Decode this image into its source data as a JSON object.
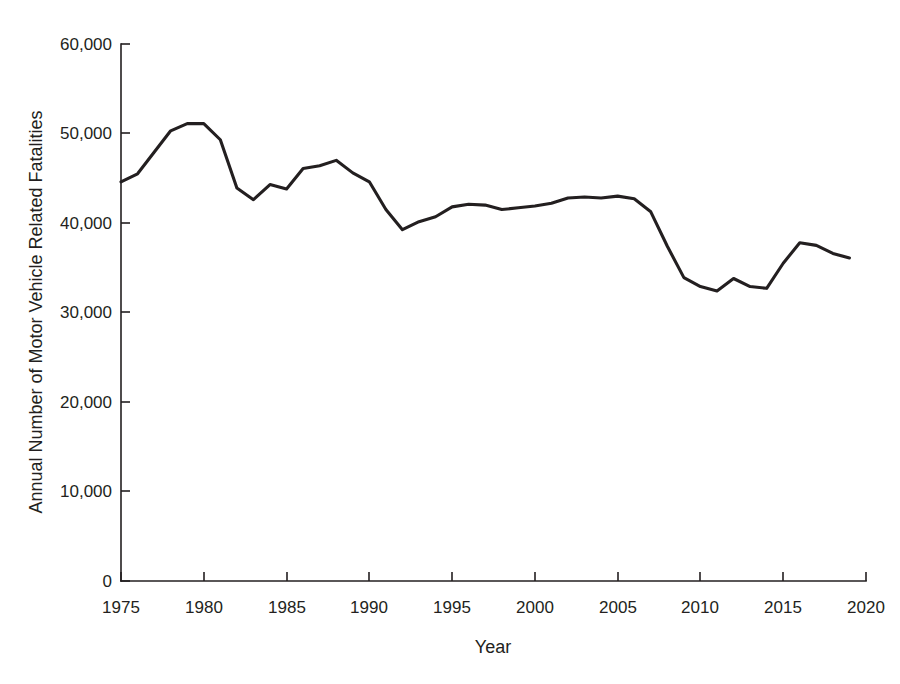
{
  "chart_data": {
    "type": "line",
    "title": "",
    "xlabel": "Year",
    "ylabel": "Annual Number of Motor Vehicle Related Fatalities",
    "xlim": [
      1975,
      2020
    ],
    "ylim": [
      0,
      60000
    ],
    "grid": false,
    "legend": "none",
    "line_color": "#231f20",
    "background_color": "#ffffff",
    "x_tick_labels": [
      "1975",
      "1980",
      "1985",
      "1990",
      "1995",
      "2000",
      "2005",
      "2010",
      "2015",
      "2020"
    ],
    "x_ticks": [
      1975,
      1980,
      1985,
      1990,
      1995,
      2000,
      2005,
      2010,
      2015,
      2020
    ],
    "y_tick_labels": [
      "0",
      "10,000",
      "20,000",
      "30,000",
      "40,000",
      "50,000",
      "60,000"
    ],
    "y_ticks": [
      0,
      10000,
      20000,
      30000,
      40000,
      50000,
      60000
    ],
    "x": [
      1975,
      1976,
      1977,
      1978,
      1979,
      1980,
      1981,
      1982,
      1983,
      1984,
      1985,
      1986,
      1987,
      1988,
      1989,
      1990,
      1991,
      1992,
      1993,
      1994,
      1995,
      1996,
      1997,
      1998,
      1999,
      2000,
      2001,
      2002,
      2003,
      2004,
      2005,
      2006,
      2007,
      2008,
      2009,
      2010,
      2011,
      2012,
      2013,
      2014,
      2015,
      2016,
      2017,
      2018,
      2019
    ],
    "values": [
      44600,
      45500,
      47900,
      50300,
      51100,
      51100,
      49300,
      43900,
      42600,
      44300,
      43800,
      46100,
      46400,
      47000,
      45600,
      44600,
      41500,
      39250,
      40150,
      40700,
      41800,
      42100,
      42000,
      41500,
      41700,
      41900,
      42200,
      42800,
      42900,
      42800,
      43000,
      42700,
      41250,
      37400,
      33900,
      32900,
      32400,
      33800,
      32900,
      32700,
      35500,
      37800,
      37500,
      36600,
      36100
    ]
  }
}
